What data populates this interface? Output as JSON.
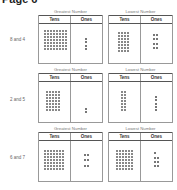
{
  "page_title": "Page 6",
  "column_headers": {
    "tens": "Tens",
    "ones": "Ones"
  },
  "captions": {
    "greatest": "Greatest Number",
    "lowest": "Lowest Number"
  },
  "sections": [
    {
      "label": "8 and 4",
      "greatest": {
        "tens": 8,
        "ones": 4
      },
      "lowest": {
        "tens": 4,
        "ones": 8
      }
    },
    {
      "label": "2 and 5",
      "greatest": {
        "tens": 5,
        "ones": 2
      },
      "lowest": {
        "tens": 2,
        "ones": 5
      }
    },
    {
      "label": "6 and 7",
      "greatest": {
        "tens": 7,
        "ones": 6
      },
      "lowest": {
        "tens": 6,
        "ones": 7
      }
    }
  ],
  "colors": {
    "border": "#999999",
    "header_rule": "#555555",
    "block_fill": "#888888"
  }
}
